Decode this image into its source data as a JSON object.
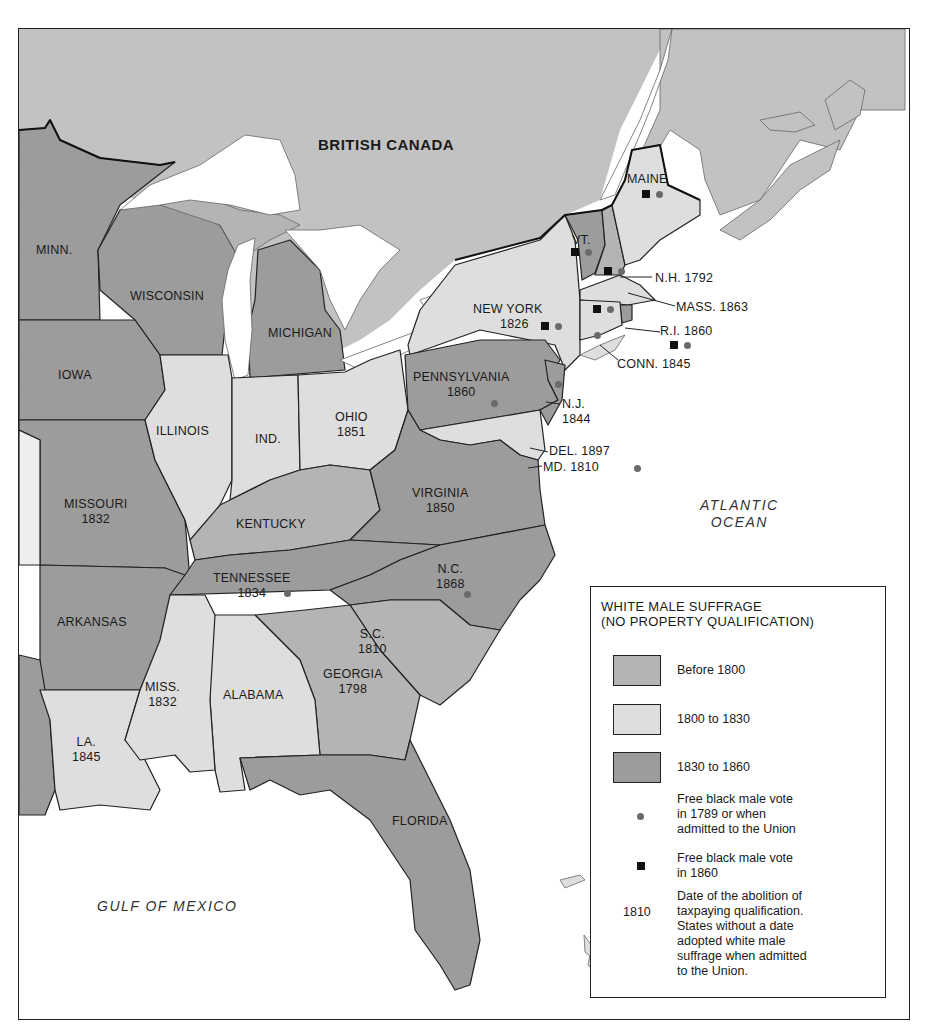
{
  "map": {
    "title_region": "BRITISH CANADA",
    "water_labels": {
      "atlantic_line1": "ATLANTIC",
      "atlantic_line2": "OCEAN",
      "gulf": "GULF OF MEXICO"
    },
    "colors": {
      "before_1800": "#b4b4b4",
      "from_1800_to_1830": "#dedede",
      "from_1830_to_1860": "#9c9c9c",
      "canada": "#c2c2c2",
      "water": "#ffffff",
      "dot": "#6a6a6a",
      "square": "#111111"
    },
    "states": [
      {
        "name": "MAINE",
        "year": "",
        "category": "1800 to 1830",
        "dot": true,
        "square": true
      },
      {
        "name": "VT.",
        "year": "",
        "category": "Before 1800",
        "dot": true,
        "square": true
      },
      {
        "name": "N.H.",
        "year": "1792",
        "category": "Before 1800",
        "dot": true,
        "square": true
      },
      {
        "name": "MASS.",
        "year": "1863",
        "category": "1800 to 1830",
        "dot": true,
        "square": true
      },
      {
        "name": "R.I.",
        "year": "1860",
        "category": "1830 to 1860",
        "dot": true,
        "square": true
      },
      {
        "name": "CONN.",
        "year": "1845",
        "category": "1800 to 1830",
        "dot": true,
        "square": false
      },
      {
        "name": "NEW YORK",
        "year": "1826",
        "category": "1800 to 1830",
        "dot": true,
        "square": true
      },
      {
        "name": "PENNSYLVANIA",
        "year": "1860",
        "category": "1830 to 1860",
        "dot": true,
        "square": false
      },
      {
        "name": "N.J.",
        "year": "1844",
        "category": "1830 to 1860",
        "dot": true,
        "square": false
      },
      {
        "name": "DEL.",
        "year": "1897",
        "category": "1800 to 1830",
        "dot": false,
        "square": false
      },
      {
        "name": "MD.",
        "year": "1810",
        "category": "1800 to 1830",
        "dot": true,
        "square": false
      },
      {
        "name": "VIRGINIA",
        "year": "1850",
        "category": "1830 to 1860",
        "dot": false,
        "square": false
      },
      {
        "name": "N.C.",
        "year": "1868",
        "category": "1830 to 1860",
        "dot": true,
        "square": false
      },
      {
        "name": "S.C.",
        "year": "1810",
        "category": "Before 1800",
        "dot": false,
        "square": false
      },
      {
        "name": "GEORGIA",
        "year": "1798",
        "category": "Before 1800",
        "dot": false,
        "square": false
      },
      {
        "name": "FLORIDA",
        "year": "",
        "category": "1830 to 1860",
        "dot": false,
        "square": false
      },
      {
        "name": "ALABAMA",
        "year": "",
        "category": "1800 to 1830",
        "dot": false,
        "square": false
      },
      {
        "name": "MISS.",
        "year": "1832",
        "category": "1800 to 1830",
        "dot": false,
        "square": false
      },
      {
        "name": "LA.",
        "year": "1845",
        "category": "1800 to 1830",
        "dot": false,
        "square": false
      },
      {
        "name": "TENNESSEE",
        "year": "1834",
        "category": "1830 to 1860",
        "dot": true,
        "square": false
      },
      {
        "name": "KENTUCKY",
        "year": "",
        "category": "Before 1800",
        "dot": false,
        "square": false
      },
      {
        "name": "OHIO",
        "year": "1851",
        "category": "1800 to 1830",
        "dot": false,
        "square": false
      },
      {
        "name": "IND.",
        "year": "",
        "category": "1800 to 1830",
        "dot": false,
        "square": false
      },
      {
        "name": "ILLINOIS",
        "year": "",
        "category": "1800 to 1830",
        "dot": false,
        "square": false
      },
      {
        "name": "MICHIGAN",
        "year": "",
        "category": "1830 to 1860",
        "dot": false,
        "square": false
      },
      {
        "name": "WISCONSIN",
        "year": "",
        "category": "1830 to 1860",
        "dot": false,
        "square": false
      },
      {
        "name": "MINN.",
        "year": "",
        "category": "1830 to 1860",
        "dot": false,
        "square": false
      },
      {
        "name": "IOWA",
        "year": "",
        "category": "1830 to 1860",
        "dot": false,
        "square": false
      },
      {
        "name": "MISSOURI",
        "year": "1832",
        "category": "1830 to 1860",
        "dot": false,
        "square": false
      },
      {
        "name": "ARKANSAS",
        "year": "",
        "category": "1830 to 1860",
        "dot": false,
        "square": false
      }
    ],
    "labels": {
      "maine": "MAINE",
      "vt": "VT.",
      "nh": "N.H. 1792",
      "mass": "MASS. 1863",
      "ri": "R.I. 1860",
      "conn": "CONN. 1845",
      "ny1": "NEW YORK",
      "ny2": "1826",
      "pa1": "PENNSYLVANIA",
      "pa2": "1860",
      "nj1": "N.J.",
      "nj2": "1844",
      "del": "DEL. 1897",
      "md": "MD. 1810",
      "va1": "VIRGINIA",
      "va2": "1850",
      "nc1": "N.C.",
      "nc2": "1868",
      "sc1": "S.C.",
      "sc2": "1810",
      "ga1": "GEORGIA",
      "ga2": "1798",
      "fl": "FLORIDA",
      "al": "ALABAMA",
      "ms1": "MISS.",
      "ms2": "1832",
      "la1": "LA.",
      "la2": "1845",
      "tn1": "TENNESSEE",
      "tn2": "1834",
      "ky": "KENTUCKY",
      "oh1": "OHIO",
      "oh2": "1851",
      "ind": "IND.",
      "il": "ILLINOIS",
      "mi": "MICHIGAN",
      "wi": "WISCONSIN",
      "mn": "MINN.",
      "ia": "IOWA",
      "mo1": "MISSOURI",
      "mo2": "1832",
      "ar": "ARKANSAS"
    }
  },
  "legend": {
    "title_line1": "WHITE MALE SUFFRAGE",
    "title_line2": "(NO PROPERTY QUALIFICATION)",
    "items": [
      {
        "label": "Before 1800",
        "color": "#b4b4b4"
      },
      {
        "label": "1800 to 1830",
        "color": "#dedede"
      },
      {
        "label": "1830 to 1860",
        "color": "#9c9c9c"
      }
    ],
    "dot_text": [
      "Free black male vote",
      "in 1789 or when",
      "admitted to the Union"
    ],
    "square_text": [
      "Free black male vote",
      "in 1860"
    ],
    "year_sample": "1810",
    "year_text": [
      "Date of the abolition of",
      "taxpaying qualification.",
      "States without a date",
      "adopted white male",
      "suffrage when admitted",
      "to the Union."
    ]
  }
}
